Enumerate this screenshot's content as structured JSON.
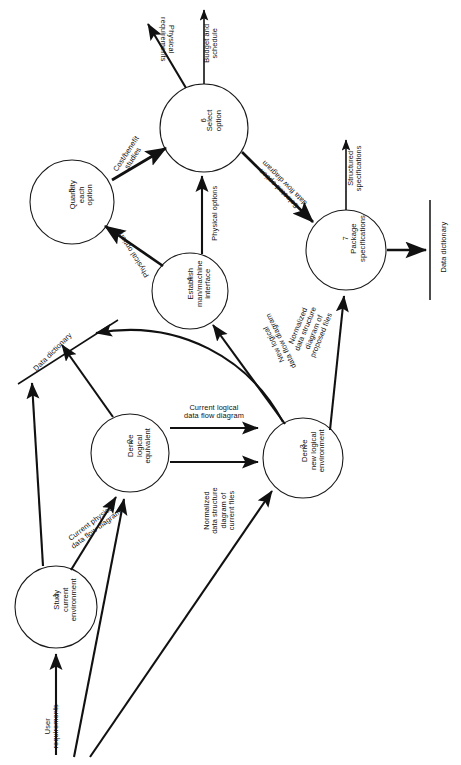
{
  "diagram": {
    "orientation": "rotated-90",
    "stroke_color": "#111111",
    "background_color": "#ffffff"
  },
  "processes": [
    {
      "id": "1",
      "number": "1",
      "name": "Study\ncurrent\nenvironment",
      "cx": 56,
      "cy": 607,
      "r": 41
    },
    {
      "id": "2",
      "number": "2",
      "name": "Derive\nlogical\nequivalent",
      "cx": 130,
      "cy": 453,
      "r": 39
    },
    {
      "id": "3",
      "number": "3",
      "name": "Derive\nnew logical\nenvironment",
      "cx": 303,
      "cy": 458,
      "r": 40
    },
    {
      "id": "4",
      "number": "4",
      "name": "Establish\nman/machine\ninterface",
      "cx": 190,
      "cy": 291,
      "r": 38
    },
    {
      "id": "5",
      "number": "5",
      "name": "Quantity\neach\noption",
      "cx": 72,
      "cy": 202,
      "r": 42
    },
    {
      "id": "6",
      "number": "6",
      "name": "Select\noption",
      "cx": 204,
      "cy": 128,
      "r": 44
    },
    {
      "id": "7",
      "number": "7",
      "name": "Package\nspecifications",
      "cx": 346,
      "cy": 250,
      "r": 40
    }
  ],
  "data_stores": [
    {
      "id": "ds-left",
      "label": "Data dictionary",
      "orientation": "diagonal"
    },
    {
      "id": "ds-right",
      "label": "Data dictionary",
      "orientation": "vertical"
    }
  ],
  "external_flows": [
    {
      "id": "user-requirements",
      "label": "User\nrequirements",
      "direction": "in"
    },
    {
      "id": "budget-and-schedule",
      "label": "Budget and\nschedule",
      "direction": "out"
    },
    {
      "id": "physical-requirements",
      "label": "Physical\nrequirements",
      "direction": "out"
    },
    {
      "id": "structured-specifications",
      "label": "Structured\nspecifications",
      "direction": "out"
    }
  ],
  "flows": [
    {
      "id": "f1",
      "from": "1",
      "to": "2",
      "label": "Current physical\ndata flow diagram"
    },
    {
      "id": "f2",
      "from": "2",
      "to": "3",
      "label": "Current logical\ndata flow diagram"
    },
    {
      "id": "f3",
      "from": "2",
      "to": "3",
      "label": "Normalized\ndata structure\ndiagram of\ncurrent files"
    },
    {
      "id": "f4",
      "from": "3",
      "to": "4",
      "label": "New logical\ndata flow diagram"
    },
    {
      "id": "f5",
      "from": "3",
      "to": "7",
      "label": "Normalized\ndata structure\ndiagram of\nproposed files"
    },
    {
      "id": "f6",
      "from": "4",
      "to": "5",
      "label": "Physical options"
    },
    {
      "id": "f7",
      "from": "4",
      "to": "6",
      "label": "Physical options"
    },
    {
      "id": "f8",
      "from": "5",
      "to": "6",
      "label": "Cost/benefit\nstudies"
    },
    {
      "id": "f9",
      "from": "6",
      "to": "7",
      "label": "Selected option\ndata flow diagram"
    }
  ]
}
